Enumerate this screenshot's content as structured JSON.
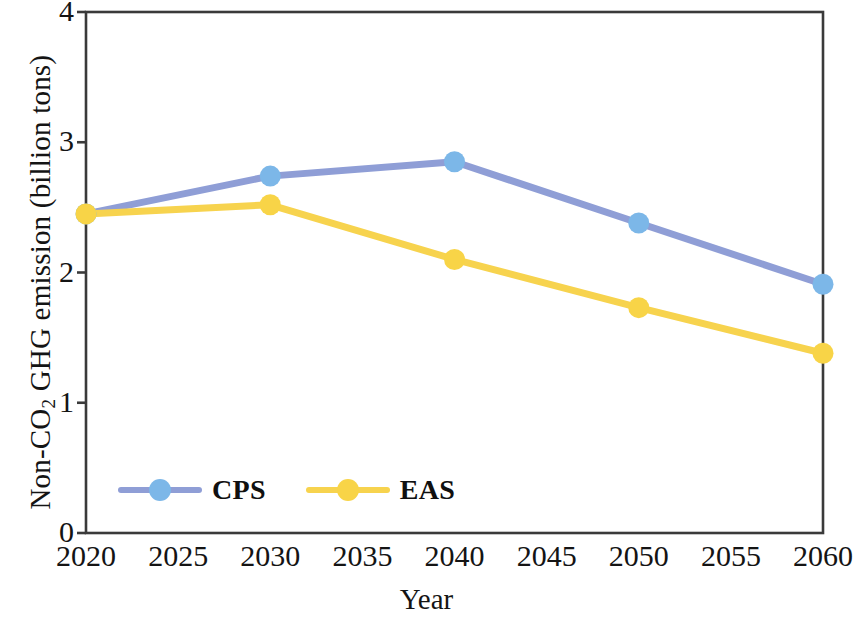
{
  "chart_data": {
    "type": "line",
    "title": "",
    "xlabel": "Year",
    "ylabel": "Non-CO2 GHG emission (billion tons)",
    "ylabel_parts": {
      "prefix": "Non-CO",
      "subscript": "2",
      "suffix": " GHG emission (billion tons)"
    },
    "x": [
      2020,
      2030,
      2040,
      2050,
      2060
    ],
    "xticks": [
      "2020",
      "2025",
      "2030",
      "2035",
      "2040",
      "2045",
      "2050",
      "2055",
      "2060"
    ],
    "xtick_values": [
      2020,
      2025,
      2030,
      2035,
      2040,
      2045,
      2050,
      2055,
      2060
    ],
    "yticks": [
      "0",
      "1",
      "2",
      "3",
      "4"
    ],
    "ytick_values": [
      0,
      1,
      2,
      3,
      4
    ],
    "xlim": [
      2020,
      2060
    ],
    "ylim": [
      0,
      4
    ],
    "grid": false,
    "legend_position": "inside-lower-left",
    "series": [
      {
        "name": "CPS",
        "values": [
          2.45,
          2.74,
          2.85,
          2.38,
          1.91
        ],
        "line_color": "#8f9ed6",
        "marker_color": "#7cb7e8"
      },
      {
        "name": "EAS",
        "values": [
          2.45,
          2.52,
          2.1,
          1.73,
          1.38
        ],
        "line_color": "#f7d34e",
        "marker_color": "#f8d447"
      }
    ]
  },
  "axes": {
    "frame_color": "#3a3a3a"
  }
}
